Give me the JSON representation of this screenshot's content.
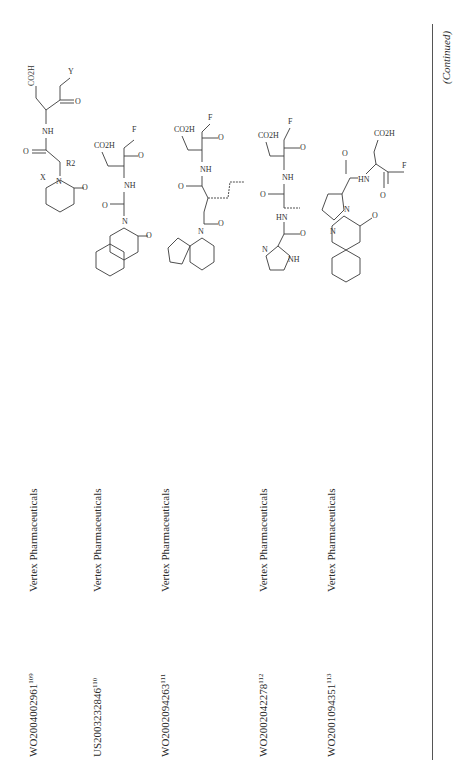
{
  "page": {
    "orientation": "rotated-90-ccw",
    "continued_label": "(Continued)"
  },
  "table": {
    "rows": [
      {
        "patent": "WO2004002961",
        "ref": "109",
        "company": "Vertex Pharmaceuticals",
        "structure": {
          "name": "quinazolinone-acetamide-aspartyl-ketone",
          "labels": [
            "R3",
            "R4",
            "X",
            "N",
            "O",
            "R2",
            "NH",
            "CO2H",
            "O",
            "Y"
          ]
        }
      },
      {
        "patent": "US2003232846",
        "ref": "110",
        "company": "Vertex Pharmaceuticals",
        "structure": {
          "name": "isoquinolinone-acetamide-aspartyl-fluoromethylketone",
          "labels": [
            "N",
            "O",
            "NH",
            "CO2H",
            "O",
            "F"
          ]
        }
      },
      {
        "patent": "WO2002094263",
        "ref": "111",
        "company": "Vertex Pharmaceuticals",
        "structure": {
          "name": "carbazole-propyl-amide-aspartyl-fluoromethylketone",
          "labels": [
            "N",
            "O",
            "NH",
            "CO2H",
            "O",
            "F"
          ]
        }
      },
      {
        "patent": "WO2002042278",
        "ref": "112",
        "company": "Vertex Pharmaceuticals",
        "structure": {
          "name": "imidazole-carbonyl-alanyl-aspartyl-fluoromethylketone",
          "labels": [
            "N",
            "NH",
            "O",
            "NH",
            "O",
            "NH",
            "CO2H",
            "O",
            "F"
          ]
        }
      },
      {
        "patent": "WO2001094351",
        "ref": "113",
        "company": "Vertex Pharmaceuticals",
        "structure": {
          "name": "pyrroloquinazolinone-carbonyl-aspartyl-fluoromethylketone",
          "labels": [
            "N",
            "N",
            "O",
            "O",
            "HN",
            "CO2H",
            "O",
            "F"
          ]
        }
      }
    ]
  }
}
